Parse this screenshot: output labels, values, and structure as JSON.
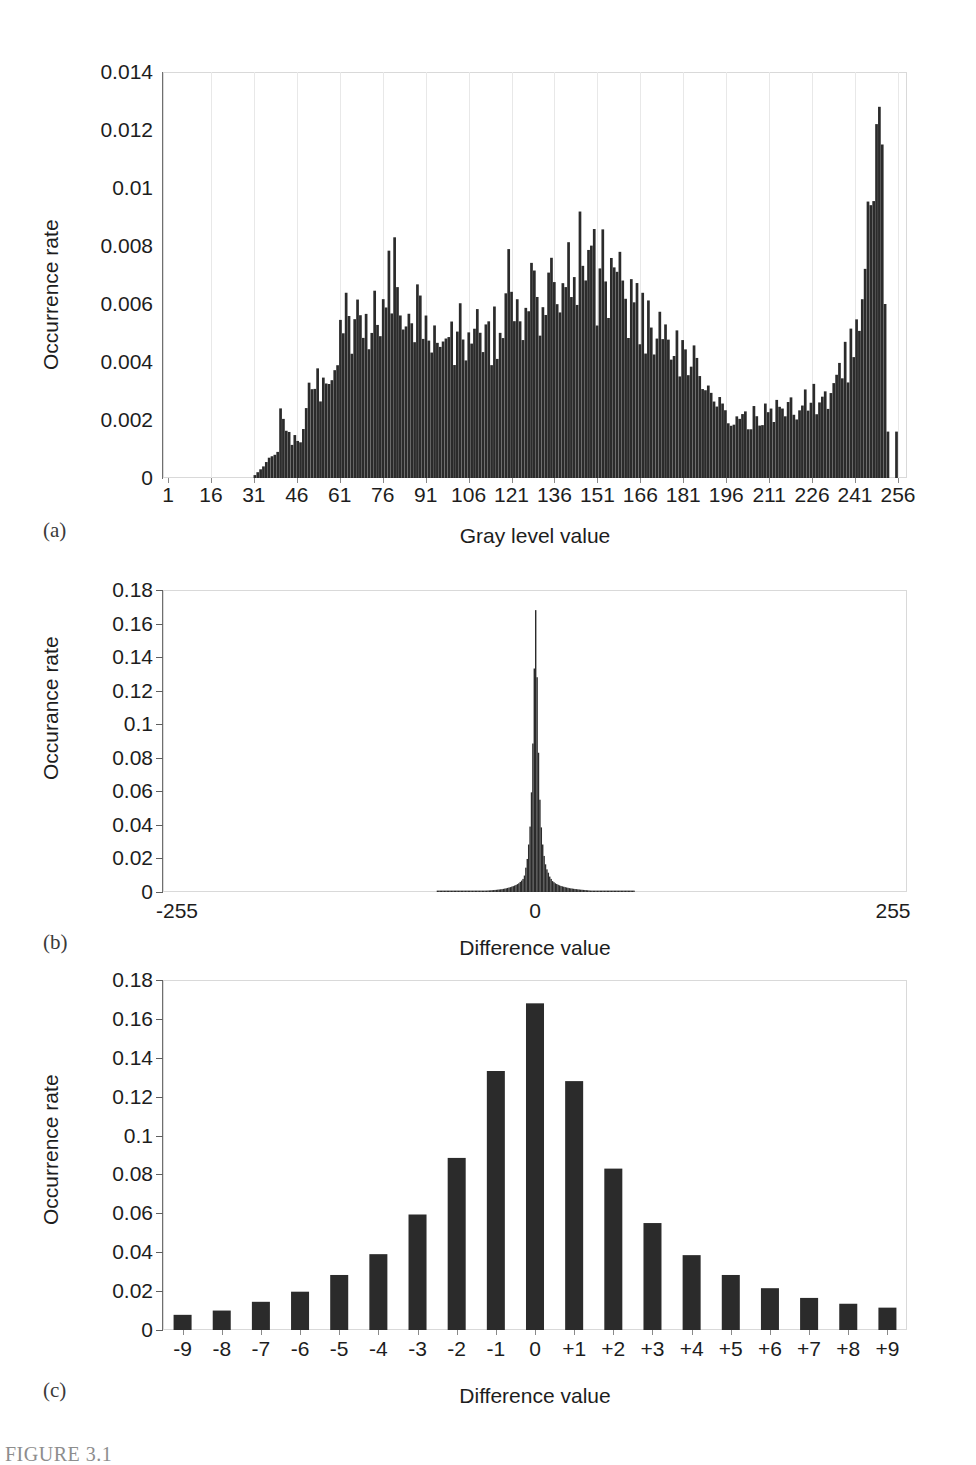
{
  "figure": {
    "caption": "FIGURE 3.1",
    "panel_tags": [
      "(a)",
      "(b)",
      "(c)"
    ]
  },
  "panel_a": {
    "tag": "(a)",
    "ylabel": "Occurrence rate",
    "xlabel": "Gray level value",
    "ytick_labels": [
      "0.014",
      "0.012",
      "0.01",
      "0.008",
      "0.006",
      "0.004",
      "0.002",
      "0"
    ],
    "xtick_labels": [
      "1",
      "16",
      "31",
      "46",
      "61",
      "76",
      "91",
      "106",
      "121",
      "136",
      "151",
      "166",
      "181",
      "196",
      "211",
      "226",
      "241",
      "256"
    ]
  },
  "panel_b": {
    "tag": "(b)",
    "ylabel": "Occurance rate",
    "xlabel": "Difference value",
    "ytick_labels": [
      "0.18",
      "0.16",
      "0.14",
      "0.12",
      "0.1",
      "0.08",
      "0.06",
      "0.04",
      "0.02",
      "0"
    ],
    "xtick_labels": [
      "-255",
      "0",
      "255"
    ]
  },
  "panel_c": {
    "tag": "(c)",
    "ylabel": "Occurrence rate",
    "xlabel": "Difference value",
    "ytick_labels": [
      "0.18",
      "0.16",
      "0.14",
      "0.12",
      "0.1",
      "0.08",
      "0.06",
      "0.04",
      "0.02",
      "0"
    ],
    "xtick_labels": [
      "-9",
      "-8",
      "-7",
      "-6",
      "-5",
      "-4",
      "-3",
      "-2",
      "-1",
      "0",
      "+1",
      "+2",
      "+3",
      "+4",
      "+5",
      "+6",
      "+7",
      "+8",
      "+9"
    ]
  },
  "colors": {
    "bar": "#2b2b2b",
    "frame": "#d9d9d9",
    "axis": "#6f6f6f",
    "text": "#1d1d1d"
  },
  "chart_data": [
    {
      "type": "bar",
      "id": "panel-a",
      "title": "",
      "xlabel": "Gray level value",
      "ylabel": "Occurrence rate",
      "ylim": [
        0,
        0.014
      ],
      "xlim": [
        1,
        256
      ],
      "yticks": [
        0,
        0.002,
        0.004,
        0.006,
        0.008,
        0.01,
        0.012,
        0.014
      ],
      "xticks": [
        1,
        16,
        31,
        46,
        61,
        76,
        91,
        106,
        121,
        136,
        151,
        166,
        181,
        196,
        211,
        226,
        241,
        256
      ],
      "grid": "vertical-light",
      "legend": "none",
      "note": "Gray level histogram of a natural image: near-zero below 38, rising hump 46-96, broad plateau 100-185, decline to 200, low shelf 200-240, sharp spike near 256 peaking at 0.0128",
      "categories": [
        1,
        5,
        10,
        15,
        20,
        25,
        30,
        34,
        36,
        38,
        39,
        40,
        41,
        42,
        43,
        44,
        45,
        46,
        47,
        48,
        49,
        50,
        51,
        52,
        53,
        54,
        55,
        56,
        57,
        58,
        59,
        60,
        61,
        62,
        63,
        64,
        65,
        66,
        67,
        68,
        69,
        70,
        71,
        72,
        73,
        74,
        75,
        76,
        77,
        78,
        79,
        80,
        81,
        82,
        83,
        84,
        85,
        86,
        87,
        88,
        89,
        90,
        91,
        92,
        93,
        94,
        95,
        96,
        97,
        98,
        99,
        100,
        101,
        102,
        103,
        104,
        105,
        106,
        107,
        108,
        109,
        110,
        111,
        112,
        113,
        114,
        115,
        116,
        117,
        118,
        119,
        120,
        121,
        122,
        123,
        124,
        125,
        126,
        127,
        128,
        129,
        130,
        131,
        132,
        133,
        134,
        135,
        136,
        137,
        138,
        139,
        140,
        141,
        142,
        143,
        144,
        145,
        146,
        147,
        148,
        149,
        150,
        151,
        152,
        153,
        154,
        155,
        156,
        157,
        158,
        159,
        160,
        161,
        162,
        163,
        164,
        165,
        166,
        167,
        168,
        169,
        170,
        171,
        172,
        173,
        174,
        175,
        176,
        177,
        178,
        179,
        180,
        181,
        182,
        183,
        184,
        185,
        186,
        187,
        188,
        189,
        190,
        191,
        192,
        193,
        194,
        195,
        196,
        197,
        198,
        199,
        200,
        202,
        204,
        206,
        208,
        210,
        212,
        214,
        216,
        218,
        220,
        222,
        224,
        226,
        228,
        230,
        232,
        234,
        236,
        238,
        240,
        242,
        244,
        245,
        246,
        247,
        248,
        249,
        250,
        251,
        252,
        253,
        254,
        255,
        256
      ],
      "values": [
        0,
        0,
        0,
        0,
        0,
        0,
        0,
        0.0004,
        0.0007,
        0.0008,
        0.0009,
        0.0024,
        0.0019,
        0.0014,
        0.0013,
        0.0012,
        0.0015,
        0.0013,
        0.0014,
        0.0016,
        0.003,
        0.0027,
        0.0025,
        0.0026,
        0.0032,
        0.0033,
        0.0031,
        0.0038,
        0.0035,
        0.0037,
        0.004,
        0.0042,
        0.0046,
        0.005,
        0.0052,
        0.0048,
        0.0047,
        0.005,
        0.0056,
        0.0049,
        0.0053,
        0.0051,
        0.0055,
        0.0052,
        0.0054,
        0.005,
        0.0058,
        0.0053,
        0.006,
        0.0068,
        0.0062,
        0.0072,
        0.0063,
        0.0061,
        0.0058,
        0.0056,
        0.006,
        0.0063,
        0.0057,
        0.0055,
        0.0059,
        0.0051,
        0.0048,
        0.005,
        0.0046,
        0.0049,
        0.0044,
        0.0047,
        0.0046,
        0.005,
        0.0048,
        0.0052,
        0.0047,
        0.0049,
        0.0051,
        0.0047,
        0.005,
        0.0046,
        0.0048,
        0.0047,
        0.0051,
        0.005,
        0.0046,
        0.0049,
        0.0046,
        0.0045,
        0.0048,
        0.0044,
        0.0046,
        0.0048,
        0.0052,
        0.007,
        0.006,
        0.0056,
        0.0058,
        0.0063,
        0.0055,
        0.0059,
        0.0057,
        0.0066,
        0.006,
        0.0063,
        0.0057,
        0.0061,
        0.0065,
        0.0058,
        0.0062,
        0.0064,
        0.0059,
        0.0068,
        0.0063,
        0.007,
        0.0066,
        0.0074,
        0.0076,
        0.0072,
        0.0078,
        0.0071,
        0.0069,
        0.0073,
        0.0067,
        0.0072,
        0.0064,
        0.0068,
        0.007,
        0.0066,
        0.0062,
        0.0065,
        0.0063,
        0.0069,
        0.0066,
        0.006,
        0.0064,
        0.0058,
        0.0062,
        0.0057,
        0.006,
        0.0054,
        0.0057,
        0.0052,
        0.0055,
        0.005,
        0.0053,
        0.0048,
        0.0051,
        0.0046,
        0.0049,
        0.0044,
        0.0047,
        0.0042,
        0.0045,
        0.004,
        0.0043,
        0.0038,
        0.0041,
        0.0036,
        0.0038,
        0.0034,
        0.0036,
        0.0032,
        0.0034,
        0.003,
        0.0029,
        0.0027,
        0.0026,
        0.0025,
        0.0024,
        0.0023,
        0.0022,
        0.0021,
        0.0021,
        0.002,
        0.002,
        0.0021,
        0.0021,
        0.0022,
        0.0022,
        0.0023,
        0.0023,
        0.0024,
        0.0024,
        0.0025,
        0.0025,
        0.0026,
        0.0026,
        0.0027,
        0.0028,
        0.0029,
        0.0031,
        0.0034,
        0.0038,
        0.0044,
        0.0052,
        0.0062,
        0.0072,
        0.0084,
        0.0096,
        0.0106,
        0.0116,
        0.0128,
        0.0115,
        0.006,
        0.0016
      ]
    },
    {
      "type": "bar",
      "id": "panel-b",
      "title": "",
      "xlabel": "Difference value",
      "ylabel": "Occurance rate",
      "ylim": [
        0,
        0.18
      ],
      "xlim": [
        -255,
        255
      ],
      "yticks": [
        0,
        0.02,
        0.04,
        0.06,
        0.08,
        0.1,
        0.12,
        0.14,
        0.16,
        0.18
      ],
      "xticks": [
        -255,
        0,
        255
      ],
      "grid": "none",
      "legend": "none",
      "note": "Laplacian-like difference histogram, sharply peaked at 0 (0.168), effectively zero beyond about +/-60",
      "categories": [
        -70,
        -60,
        -50,
        -45,
        -40,
        -36,
        -32,
        -28,
        -24,
        -21,
        -18,
        -16,
        -14,
        -12,
        -11,
        -10,
        -9,
        -8,
        -7,
        -6,
        -5,
        -4,
        -3,
        -2,
        -1,
        0,
        1,
        2,
        3,
        4,
        5,
        6,
        7,
        8,
        9,
        10,
        11,
        12,
        14,
        16,
        18,
        21,
        24,
        28,
        32,
        36,
        40,
        45,
        50,
        60,
        70
      ],
      "values": [
        0.0002,
        0.0003,
        0.0004,
        0.0005,
        0.0006,
        0.0008,
        0.001,
        0.0013,
        0.0017,
        0.0022,
        0.0029,
        0.0035,
        0.0042,
        0.0052,
        0.006,
        0.0068,
        0.0078,
        0.0098,
        0.0145,
        0.0197,
        0.0283,
        0.039,
        0.0594,
        0.0885,
        0.1332,
        0.168,
        0.128,
        0.083,
        0.055,
        0.0385,
        0.0283,
        0.0215,
        0.0165,
        0.0135,
        0.0115,
        0.0092,
        0.0078,
        0.0065,
        0.0052,
        0.0043,
        0.0036,
        0.0029,
        0.0023,
        0.0018,
        0.0014,
        0.0011,
        0.0008,
        0.0006,
        0.0005,
        0.0003,
        0.0002
      ]
    },
    {
      "type": "bar",
      "id": "panel-c",
      "title": "",
      "xlabel": "Difference value",
      "ylabel": "Occurrence rate",
      "ylim": [
        0,
        0.18
      ],
      "xlim": [
        -9.5,
        9.5
      ],
      "yticks": [
        0,
        0.02,
        0.04,
        0.06,
        0.08,
        0.1,
        0.12,
        0.14,
        0.16,
        0.18
      ],
      "grid": "none",
      "legend": "none",
      "categories": [
        "-9",
        "-8",
        "-7",
        "-6",
        "-5",
        "-4",
        "-3",
        "-2",
        "-1",
        "0",
        "+1",
        "+2",
        "+3",
        "+4",
        "+5",
        "+6",
        "+7",
        "+8",
        "+9"
      ],
      "values": [
        0.0078,
        0.01,
        0.0145,
        0.0197,
        0.0283,
        0.039,
        0.0594,
        0.0885,
        0.1332,
        0.168,
        0.128,
        0.083,
        0.055,
        0.0385,
        0.0283,
        0.0215,
        0.0165,
        0.0135,
        0.0115
      ]
    }
  ]
}
